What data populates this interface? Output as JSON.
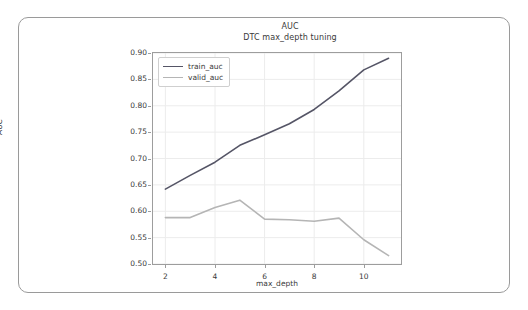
{
  "chart_data": {
    "type": "line",
    "title": "AUC",
    "subtitle": "DTC max_depth tuning",
    "xlabel": "max_depth",
    "ylabel": "AUC",
    "xlim": [
      1.5,
      11.5
    ],
    "ylim": [
      0.5,
      0.9
    ],
    "grid": true,
    "legend_position": "upper left",
    "x": [
      2,
      3,
      4,
      5,
      6,
      7,
      8,
      9,
      10,
      11
    ],
    "xticks": [
      2,
      4,
      6,
      8,
      10
    ],
    "xtick_labels": [
      "2",
      "4",
      "6",
      "8",
      "10"
    ],
    "yticks": [
      0.5,
      0.55,
      0.6,
      0.65,
      0.7,
      0.75,
      0.8,
      0.85,
      0.9
    ],
    "ytick_labels": [
      "0.50",
      "0.55",
      "0.60",
      "0.65",
      "0.70",
      "0.75",
      "0.80",
      "0.85",
      "0.90"
    ],
    "series": [
      {
        "name": "train_auc",
        "color": "#555566",
        "values": [
          0.642,
          0.668,
          0.693,
          0.725,
          0.745,
          0.766,
          0.793,
          0.828,
          0.868,
          0.89
        ]
      },
      {
        "name": "valid_auc",
        "color": "#b5b5b5",
        "values": [
          0.588,
          0.588,
          0.607,
          0.621,
          0.585,
          0.584,
          0.581,
          0.587,
          0.546,
          0.516
        ]
      }
    ]
  },
  "legend": {
    "items": [
      {
        "label": "train_auc",
        "color": "#555566"
      },
      {
        "label": "valid_auc",
        "color": "#b5b5b5"
      }
    ]
  },
  "colors": {
    "card_border": "#9a9a9a",
    "axis": "#9d9d9d",
    "grid": "#ececec",
    "text": "#3a3a3a",
    "background": "#ffffff"
  }
}
